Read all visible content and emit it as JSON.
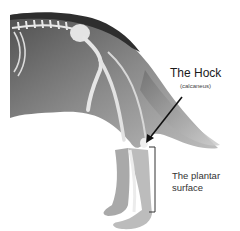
{
  "figure": {
    "colors": {
      "background": "#ffffff",
      "fur_dark": "#5a5a5a",
      "fur_mid": "#8c8c8c",
      "fur_light": "#b8b8b8",
      "bone": "#e6e6e6",
      "annotation": "#111111"
    }
  },
  "labels": {
    "hock_title": "The Hock",
    "hock_subtitle": "(calcaneus)",
    "plantar_line1": "The plantar",
    "plantar_line2": "surface"
  },
  "annotations": {
    "hock_arrow": {
      "from": [
        182,
        97
      ],
      "to": [
        146,
        143
      ]
    },
    "plantar_bracket": {
      "x": 155,
      "y_top": 147,
      "y_bottom": 212
    }
  }
}
